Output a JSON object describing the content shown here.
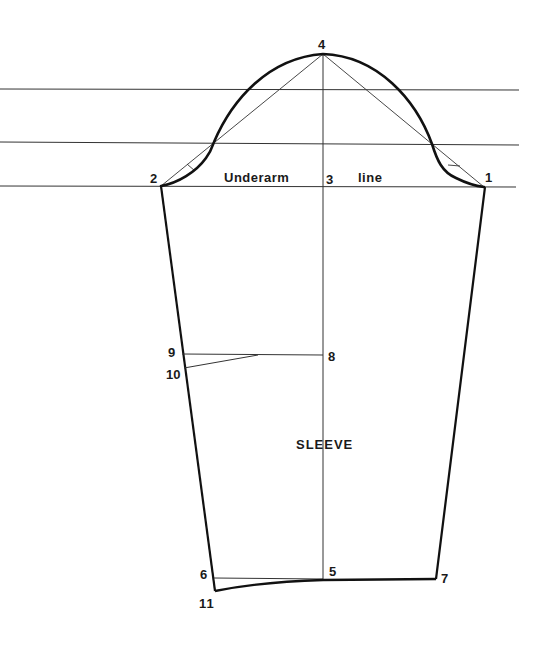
{
  "diagram": {
    "title": "SLEEVE",
    "underarm_label_left": "Underarm",
    "underarm_label_right": "line",
    "points": {
      "p1": {
        "label": "1",
        "x": 484,
        "y": 187
      },
      "p2": {
        "label": "2",
        "x": 161,
        "y": 186
      },
      "p3": {
        "label": "3",
        "x": 323,
        "y": 186
      },
      "p4": {
        "label": "4",
        "x": 323,
        "y": 54
      },
      "p5": {
        "label": "5",
        "x": 323,
        "y": 579
      },
      "p6": {
        "label": "6",
        "x": 214,
        "y": 578
      },
      "p7": {
        "label": "7",
        "x": 436,
        "y": 579
      },
      "p8": {
        "label": "8",
        "x": 323,
        "y": 355
      },
      "p9": {
        "label": "9",
        "x": 182,
        "y": 354
      },
      "p10": {
        "label": "10",
        "x": 184,
        "y": 367
      },
      "p11": {
        "label": "11",
        "x": 215,
        "y": 591
      }
    },
    "colors": {
      "line": "#2a2a2a",
      "curve": "#111111",
      "background": "#ffffff"
    }
  }
}
